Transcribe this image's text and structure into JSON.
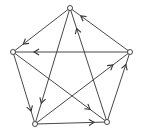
{
  "diagram": {
    "type": "directed-graph",
    "colors": {
      "edge": "#333333",
      "node_fill": "#ffffff",
      "node_stroke": "#333333",
      "background": "#ffffff"
    },
    "nodes": [
      {
        "id": "top",
        "x": 70,
        "y": 8
      },
      {
        "id": "left",
        "x": 13,
        "y": 52
      },
      {
        "id": "right",
        "x": 130,
        "y": 52
      },
      {
        "id": "bottom-left",
        "x": 35,
        "y": 124
      },
      {
        "id": "bottom-right",
        "x": 107,
        "y": 122
      }
    ],
    "edges": [
      {
        "from": "top",
        "to": "left"
      },
      {
        "from": "right",
        "to": "top"
      },
      {
        "from": "right",
        "to": "left"
      },
      {
        "from": "top",
        "to": "bottom-left"
      },
      {
        "from": "bottom-right",
        "to": "top"
      },
      {
        "from": "left",
        "to": "bottom-left"
      },
      {
        "from": "left",
        "to": "bottom-right"
      },
      {
        "from": "bottom-left",
        "to": "bottom-right"
      },
      {
        "from": "bottom-left",
        "to": "right"
      },
      {
        "from": "bottom-right",
        "to": "right"
      }
    ]
  }
}
